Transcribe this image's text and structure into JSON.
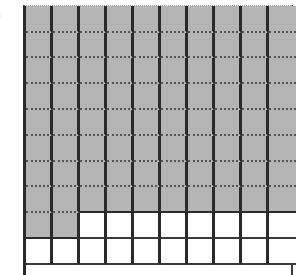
{
  "figure": {
    "label": ")",
    "grid": {
      "rows": 10,
      "columns": 10,
      "shaded_count": 82,
      "total_cells": 100,
      "fully_shaded_rows": 8,
      "partial_row_shaded_cells": 2,
      "shade_color": "#bcbcbc",
      "line_color": "#2a2a2a"
    }
  }
}
